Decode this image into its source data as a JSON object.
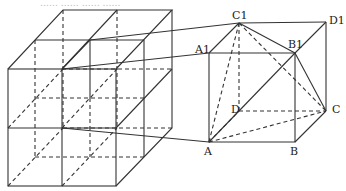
{
  "diagram": {
    "title_fragment": "…… …… …… ……",
    "left_figure": {
      "description": "large cube made of 2x2x2 unit cubes",
      "front_face": {
        "x0": 8,
        "y0": 69,
        "x1": 116,
        "y1": 186
      },
      "depth_offset": {
        "dx": 55,
        "dy": -59
      }
    },
    "right_figure": {
      "description": "unit cube ABCD-A1B1C1D1 with tetrahedron A-B1-C-C1 highlighted",
      "vertices": {
        "A": {
          "label": "A",
          "x": 209,
          "y": 142
        },
        "B": {
          "label": "B",
          "x": 295,
          "y": 142
        },
        "C": {
          "label": "C",
          "x": 326,
          "y": 111
        },
        "D": {
          "label": "D",
          "x": 239,
          "y": 111
        },
        "A1": {
          "label": "A1",
          "x": 209,
          "y": 53
        },
        "B1": {
          "label": "B1",
          "x": 295,
          "y": 53
        },
        "C1": {
          "label": "C1",
          "x": 239,
          "y": 23
        },
        "D1": {
          "label": "D1",
          "x": 326,
          "y": 22
        }
      }
    },
    "labels": {
      "A": "A",
      "B": "B",
      "C": "C",
      "D": "D",
      "A1": "A1",
      "B1": "B1",
      "C1": "C1",
      "D1": "D1"
    }
  }
}
